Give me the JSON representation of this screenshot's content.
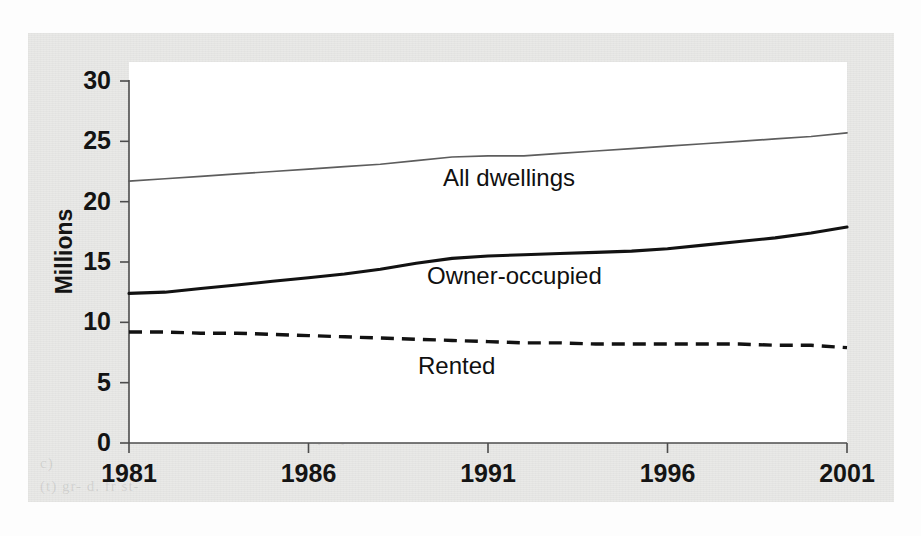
{
  "figure": {
    "background_color": "#e9e9e7",
    "plot_background_color": "#ffffff",
    "ghost_text": {
      "line1": "c)",
      "line2": "(t) gr- d. fr st-",
      "line3": "a ey d y hold-"
    }
  },
  "chart_data": {
    "type": "line",
    "title": "",
    "subtitle": "",
    "xlabel": "",
    "ylabel": "Millions",
    "xlim": [
      1981,
      2001
    ],
    "ylim": [
      0,
      30
    ],
    "grid": false,
    "legend_position": "inline-labels",
    "x_ticks": [
      "1981",
      "1986",
      "1991",
      "1996",
      "2001"
    ],
    "x_tick_values": [
      1981,
      1986,
      1991,
      1996,
      2001
    ],
    "y_ticks": [
      "0",
      "5",
      "10",
      "15",
      "20",
      "25",
      "30"
    ],
    "y_tick_values": [
      0,
      5,
      10,
      15,
      20,
      25,
      30
    ],
    "x": [
      1981,
      1982,
      1983,
      1984,
      1985,
      1986,
      1987,
      1988,
      1989,
      1990,
      1991,
      1992,
      1993,
      1994,
      1995,
      1996,
      1997,
      1998,
      1999,
      2000,
      2001
    ],
    "series": [
      {
        "name": "All dwellings",
        "style": "solid-thin",
        "color": "#5d5d5d",
        "label_x": 1993.3,
        "label_y": 20.6,
        "values": [
          21.7,
          21.9,
          22.1,
          22.3,
          22.5,
          22.7,
          22.9,
          23.1,
          23.4,
          23.7,
          23.8,
          23.8,
          24.0,
          24.2,
          24.4,
          24.6,
          24.8,
          25.0,
          25.2,
          25.4,
          25.7
        ]
      },
      {
        "name": "Owner-occupied",
        "style": "solid-thick",
        "color": "#121212",
        "label_x": 1992.8,
        "label_y": 12.6,
        "values": [
          12.4,
          12.5,
          12.8,
          13.1,
          13.4,
          13.7,
          14.0,
          14.4,
          14.9,
          15.3,
          15.5,
          15.6,
          15.7,
          15.8,
          15.9,
          16.1,
          16.4,
          16.7,
          17.0,
          17.4,
          17.9
        ]
      },
      {
        "name": "Rented",
        "style": "dashed-thick",
        "color": "#121212",
        "label_x": 1992.6,
        "label_y": 5.8,
        "values": [
          9.2,
          9.2,
          9.1,
          9.1,
          9.0,
          8.9,
          8.8,
          8.7,
          8.6,
          8.5,
          8.4,
          8.3,
          8.3,
          8.2,
          8.2,
          8.2,
          8.2,
          8.2,
          8.1,
          8.1,
          7.9
        ]
      }
    ]
  }
}
